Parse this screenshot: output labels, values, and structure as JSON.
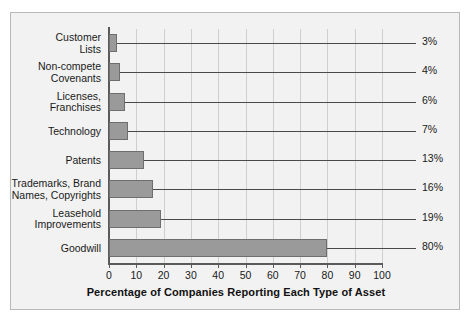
{
  "chart_data": {
    "type": "bar",
    "orientation": "horizontal",
    "title": "",
    "xlabel": "Percentage of Companies Reporting Each Type of Asset",
    "ylabel": "",
    "xlim": [
      0,
      100
    ],
    "xticks": [
      0,
      10,
      20,
      30,
      40,
      50,
      60,
      70,
      80,
      90,
      100
    ],
    "grid": "vertical",
    "legend": "none",
    "categories": [
      "Customer\nLists",
      "Non-compete\nCovenants",
      "Licenses,\nFranchises",
      "Technology",
      "Patents",
      "Trademarks, Brand\nNames, Copyrights",
      "Leasehold\nImprovements",
      "Goodwill"
    ],
    "values": [
      3,
      4,
      6,
      7,
      13,
      16,
      19,
      80
    ],
    "data_labels": [
      "3%",
      "4%",
      "6%",
      "7%",
      "13%",
      "16%",
      "19%",
      "80%"
    ],
    "bars": [
      {
        "label_line1": "Customer",
        "label_line2": "Lists",
        "value": 3,
        "data_label": "3%"
      },
      {
        "label_line1": "Non-compete",
        "label_line2": "Covenants",
        "value": 4,
        "data_label": "4%"
      },
      {
        "label_line1": "Licenses,",
        "label_line2": "Franchises",
        "value": 6,
        "data_label": "6%"
      },
      {
        "label_line1": "Technology",
        "label_line2": "",
        "value": 7,
        "data_label": "7%"
      },
      {
        "label_line1": "Patents",
        "label_line2": "",
        "value": 13,
        "data_label": "13%"
      },
      {
        "label_line1": "Trademarks, Brand",
        "label_line2": "Names, Copyrights",
        "value": 16,
        "data_label": "16%"
      },
      {
        "label_line1": "Leasehold",
        "label_line2": "Improvements",
        "value": 19,
        "data_label": "19%"
      },
      {
        "label_line1": "Goodwill",
        "label_line2": "",
        "value": 80,
        "data_label": "80%"
      }
    ],
    "colors": {
      "bar_fill": "#9a9a9a",
      "bar_border": "#6e6e6e",
      "background": "#f2f2f2",
      "frame_border": "#b8b8b8",
      "gridline": "#cfcfcf",
      "axis": "#5a5a5a",
      "leader_line": "#4a4a4a",
      "text": "#1a1a1a"
    }
  },
  "xtick_labels": [
    "0",
    "10",
    "20",
    "30",
    "40",
    "50",
    "60",
    "70",
    "80",
    "90",
    "100"
  ]
}
